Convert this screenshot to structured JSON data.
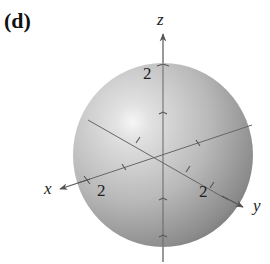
{
  "panel_label": "(d)",
  "axes": {
    "x": {
      "label": "x",
      "tick_label": "2"
    },
    "y": {
      "label": "y",
      "tick_label": "2"
    },
    "z": {
      "label": "z",
      "tick_label": "2"
    }
  },
  "sphere": {
    "radius_label": "2",
    "fill": "#b8b8b8",
    "highlight": "#f4f4f4",
    "shadow": "#6e6e6e"
  },
  "axis_color": "#555555"
}
